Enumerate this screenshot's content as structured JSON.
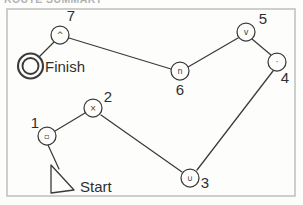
{
  "page": {
    "header_partial_text": "ROUTE SUMMARY",
    "background_color": "#fdfdfc",
    "ink_color": "#3a3a3a",
    "frame": {
      "x": 7,
      "y": 9,
      "width": 288,
      "height": 187
    }
  },
  "diagram": {
    "type": "route-map",
    "markers": [
      {
        "id": "finish",
        "name": "finish-marker",
        "label": "Finish",
        "shape": "double-ring",
        "cx": 30.5,
        "cy": 66,
        "outer_r": 12.5,
        "inner_r": 8,
        "label_x": 45,
        "label_y": 71.5
      },
      {
        "id": "start",
        "name": "start-marker",
        "label": "Start",
        "shape": "triangle",
        "points": "51,165 51,193 74,190",
        "label_x": 80,
        "label_y": 192
      }
    ],
    "nodes": [
      {
        "id": "7",
        "label": "7",
        "glyph": "^",
        "glyph_name": "caret-up-icon",
        "cx": 60,
        "cy": 35,
        "r": 9,
        "label_x": 71,
        "label_y": 21
      },
      {
        "id": "6",
        "label": "6",
        "glyph": "n",
        "glyph_name": "arch-icon",
        "cx": 180,
        "cy": 71,
        "r": 9,
        "label_x": 180,
        "label_y": 95
      },
      {
        "id": "5",
        "label": "5",
        "glyph": "v",
        "glyph_name": "caret-down-icon",
        "cx": 246,
        "cy": 32,
        "r": 9,
        "label_x": 263,
        "label_y": 24
      },
      {
        "id": "4",
        "label": "4",
        "glyph": "·",
        "glyph_name": "dot-icon",
        "cx": 277,
        "cy": 62,
        "r": 9,
        "label_x": 285,
        "label_y": 83
      },
      {
        "id": "2",
        "label": "2",
        "glyph": "×",
        "glyph_name": "cross-icon",
        "cx": 93,
        "cy": 108,
        "r": 9,
        "label_x": 108,
        "label_y": 102
      },
      {
        "id": "1",
        "label": "1",
        "glyph": "▫",
        "glyph_name": "square-icon",
        "cx": 47,
        "cy": 136,
        "r": 9,
        "label_x": 35,
        "label_y": 128
      },
      {
        "id": "3",
        "label": "3",
        "glyph": "∪",
        "glyph_name": "cup-icon",
        "cx": 190,
        "cy": 178,
        "r": 9,
        "label_x": 205,
        "label_y": 188
      }
    ],
    "edges": [
      {
        "name": "edge-finish-7",
        "from": "finish",
        "to": "7",
        "x1": 39,
        "y1": 57,
        "x2": 54,
        "y2": 42
      },
      {
        "name": "edge-7-6",
        "from": "7",
        "to": "6",
        "x1": 69,
        "y1": 38,
        "x2": 171,
        "y2": 69
      },
      {
        "name": "edge-6-5",
        "from": "6",
        "to": "5",
        "x1": 188,
        "y1": 67,
        "x2": 238,
        "y2": 38
      },
      {
        "name": "edge-5-4",
        "from": "5",
        "to": "4",
        "x1": 252,
        "y1": 39,
        "x2": 271,
        "y2": 55
      },
      {
        "name": "edge-4-3",
        "from": "4",
        "to": "3",
        "x1": 273,
        "y1": 71,
        "x2": 197,
        "y2": 170
      },
      {
        "name": "edge-3-2",
        "from": "3",
        "to": "2",
        "x1": 182,
        "y1": 172,
        "x2": 101,
        "y2": 115
      },
      {
        "name": "edge-2-1",
        "from": "2",
        "to": "1",
        "x1": 85,
        "y1": 113,
        "x2": 55,
        "y2": 131
      },
      {
        "name": "edge-1-start",
        "from": "1",
        "to": "start",
        "x1": 48,
        "y1": 145,
        "x2": 59,
        "y2": 169
      }
    ]
  }
}
